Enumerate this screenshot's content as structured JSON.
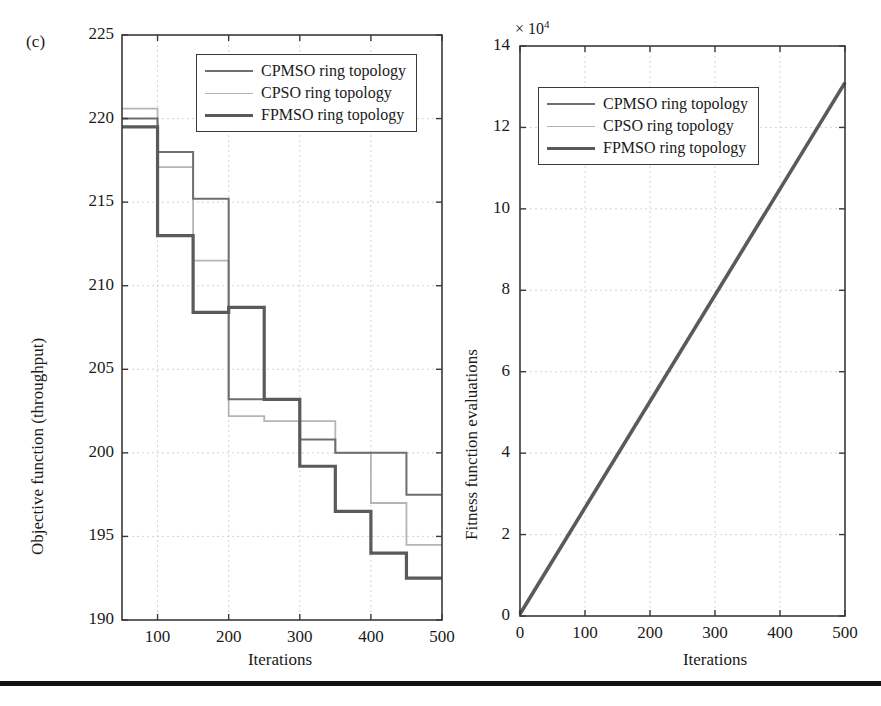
{
  "figure": {
    "panel_tag": "(c)",
    "bottom_rule_color": "#111111"
  },
  "series_styles": {
    "cpmso_color": "#6e6e6e",
    "cpso_color": "#b5b5b5",
    "fpmso_color": "#5a5a5a"
  },
  "legend": {
    "items": [
      {
        "label": "CPMSO ring topology",
        "color": "#6e6e6e",
        "width": 2.0
      },
      {
        "label": "CPSO ring topology",
        "color": "#b5b5b5",
        "width": 1.8
      },
      {
        "label": "FPMSO ring topology",
        "color": "#5a5a5a",
        "width": 3.4
      }
    ]
  },
  "chart_data": [
    {
      "id": "left",
      "type": "line",
      "title": "",
      "xlabel": "Iterations",
      "ylabel": "Objective function (throughput)",
      "xlim": [
        50,
        500
      ],
      "ylim": [
        190,
        225
      ],
      "xticks": [
        100,
        200,
        300,
        400,
        500
      ],
      "yticks": [
        190,
        195,
        200,
        205,
        210,
        215,
        220,
        225
      ],
      "grid": true,
      "legend_position": "top-right",
      "step": "post",
      "series": [
        {
          "name": "CPMSO ring topology",
          "color": "#6e6e6e",
          "x": [
            50,
            100,
            150,
            200,
            250,
            300,
            350,
            400,
            450,
            500
          ],
          "values": [
            220.0,
            220.0,
            218.0,
            218.0,
            215.2,
            215.2,
            203.2,
            203.2,
            200.8,
            200.8
          ]
        },
        {
          "name": "CPSO ring topology",
          "color": "#b5b5b5",
          "x": [
            50,
            100,
            150,
            200,
            250,
            300,
            350,
            400,
            450,
            500
          ],
          "values": [
            220.6,
            220.6,
            217.1,
            217.1,
            211.5,
            211.5,
            202.2,
            202.2,
            201.9,
            201.9
          ]
        },
        {
          "name": "FPMSO ring topology",
          "color": "#5a5a5a",
          "x": [
            50,
            100,
            150,
            200,
            250,
            300,
            350,
            400,
            450,
            500
          ],
          "values": [
            219.5,
            219.5,
            213.0,
            213.0,
            208.4,
            208.4,
            208.7,
            208.7,
            205.0,
            205.0
          ]
        }
      ],
      "step_levels": {
        "cpmso": [
          220.0,
          218.0,
          215.2,
          203.2,
          203.2,
          200.8,
          200.0,
          200.0,
          197.5
        ],
        "cpso": [
          220.6,
          217.1,
          211.5,
          202.2,
          201.9,
          201.9,
          200.0,
          197.0,
          194.5
        ],
        "fpmso": [
          219.5,
          213.0,
          208.4,
          208.7,
          203.2,
          199.2,
          196.5,
          194.0,
          192.5
        ],
        "breakpoints": [
          50,
          100,
          150,
          200,
          250,
          300,
          350,
          400,
          450,
          500
        ]
      }
    },
    {
      "id": "right",
      "type": "line",
      "title": "",
      "xlabel": "Iterations",
      "ylabel": "Fitness function evaluations",
      "y_exponent": "× 10",
      "y_exponent_sup": "4",
      "xlim": [
        0,
        500
      ],
      "ylim": [
        0,
        14
      ],
      "xticks": [
        0,
        100,
        200,
        300,
        400,
        500
      ],
      "yticks": [
        0,
        2,
        4,
        6,
        8,
        10,
        12,
        14
      ],
      "grid": true,
      "legend_position": "top-left",
      "series": [
        {
          "name": "CPMSO ring topology",
          "color": "#6e6e6e",
          "x": [
            0,
            500
          ],
          "values": [
            0.05,
            13.1
          ]
        },
        {
          "name": "CPSO ring topology",
          "color": "#b5b5b5",
          "x": [
            0,
            500
          ],
          "values": [
            0.05,
            13.1
          ]
        },
        {
          "name": "FPMSO ring topology",
          "color": "#5a5a5a",
          "x": [
            0,
            500
          ],
          "values": [
            0.05,
            13.1
          ]
        }
      ]
    }
  ]
}
